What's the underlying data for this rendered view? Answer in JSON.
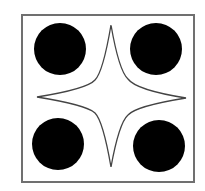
{
  "figure": {
    "background": "#ffffff",
    "frame": {
      "x": 22,
      "y": 15,
      "width": 172,
      "height": 167,
      "stroke": "#707070",
      "stroke_width": 2
    },
    "circles": [
      {
        "name": "top-left",
        "cx": 60,
        "cy": 49,
        "r": 26,
        "fill": "#000000"
      },
      {
        "name": "top-right",
        "cx": 156,
        "cy": 49,
        "r": 26,
        "fill": "#000000"
      },
      {
        "name": "bottom-left",
        "cx": 58,
        "cy": 144,
        "r": 26,
        "fill": "#000000"
      },
      {
        "name": "bottom-right",
        "cx": 159,
        "cy": 146,
        "r": 26,
        "fill": "#000000"
      }
    ],
    "star": {
      "points": {
        "top": [
          111,
          25
        ],
        "right": [
          186,
          98
        ],
        "bottom": [
          111,
          167
        ],
        "left": [
          37,
          97
        ]
      },
      "inner": {
        "top_left": [
          95,
          80
        ],
        "top_right": [
          128,
          79
        ],
        "bottom_right": [
          128,
          115
        ],
        "bottom_left": [
          95,
          113
        ]
      },
      "fill": "#ffffff",
      "stroke": "#444444",
      "stroke_width": 1.3
    }
  }
}
